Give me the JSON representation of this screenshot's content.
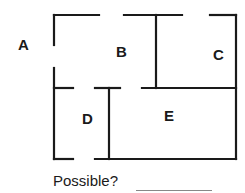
{
  "diagram": {
    "type": "floor-plan",
    "wall_color": "#1a1a1a",
    "labels": {
      "outside": "A",
      "room_b": "B",
      "room_c": "C",
      "room_d": "D",
      "room_e": "E"
    },
    "question": "Possible?",
    "answer_blank": ""
  }
}
